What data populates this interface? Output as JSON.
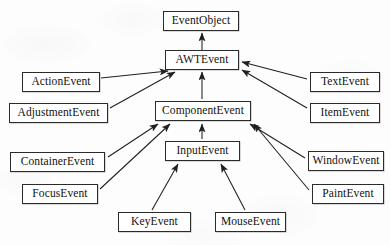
{
  "diagram": {
    "type": "class-hierarchy",
    "arrow_semantics": "generalization: arrow points from subclass to superclass",
    "canvas": {
      "width": 390,
      "height": 245
    },
    "style": {
      "background": "#fdfdfd",
      "box_fill": "#ffffff",
      "box_border": "#2b2b2b",
      "text_color": "#111111",
      "edge_color": "#1f1f1f"
    },
    "nodes": [
      {
        "id": "eventobject",
        "label": "EventObject",
        "x": 163,
        "y": 11,
        "w": 76,
        "h": 20
      },
      {
        "id": "awtevent",
        "label": "AWTEvent",
        "x": 165,
        "y": 50,
        "w": 74,
        "h": 20
      },
      {
        "id": "actionevent",
        "label": "ActionEvent",
        "x": 22,
        "y": 72,
        "w": 78,
        "h": 20
      },
      {
        "id": "textevent",
        "label": "TextEvent",
        "x": 310,
        "y": 72,
        "w": 70,
        "h": 20
      },
      {
        "id": "adjustmentevent",
        "label": "AdjustmentEvent",
        "x": 9,
        "y": 103,
        "w": 99,
        "h": 20
      },
      {
        "id": "componentevent",
        "label": "ComponentEvent",
        "x": 155,
        "y": 101,
        "w": 96,
        "h": 20
      },
      {
        "id": "itemevent",
        "label": "ItemEvent",
        "x": 310,
        "y": 103,
        "w": 70,
        "h": 20
      },
      {
        "id": "containerevent",
        "label": "ContainerEvent",
        "x": 10,
        "y": 152,
        "w": 95,
        "h": 20
      },
      {
        "id": "inputevent",
        "label": "InputEvent",
        "x": 165,
        "y": 141,
        "w": 75,
        "h": 20
      },
      {
        "id": "windowevent",
        "label": "WindowEvent",
        "x": 308,
        "y": 151,
        "w": 76,
        "h": 20
      },
      {
        "id": "focusevent",
        "label": "FocusEvent",
        "x": 22,
        "y": 184,
        "w": 76,
        "h": 20
      },
      {
        "id": "paintevent",
        "label": "PaintEvent",
        "x": 312,
        "y": 184,
        "w": 72,
        "h": 20
      },
      {
        "id": "keyevent",
        "label": "KeyEvent",
        "x": 118,
        "y": 212,
        "w": 73,
        "h": 20
      },
      {
        "id": "mouseevent",
        "label": "MouseEvent",
        "x": 215,
        "y": 212,
        "w": 71,
        "h": 20
      }
    ],
    "edges": [
      {
        "from": "awtevent",
        "to": "eventobject",
        "x1": 202,
        "y1": 50,
        "x2": 202,
        "y2": 33
      },
      {
        "from": "actionevent",
        "to": "awtevent",
        "x1": 101,
        "y1": 78,
        "x2": 168,
        "y2": 71
      },
      {
        "from": "adjustmentevent",
        "to": "awtevent",
        "x1": 110,
        "y1": 108,
        "x2": 175,
        "y2": 72
      },
      {
        "from": "componentevent",
        "to": "awtevent",
        "x1": 202,
        "y1": 99,
        "x2": 202,
        "y2": 72
      },
      {
        "from": "textevent",
        "to": "awtevent",
        "x1": 307,
        "y1": 79,
        "x2": 242,
        "y2": 62
      },
      {
        "from": "itemevent",
        "to": "awtevent",
        "x1": 307,
        "y1": 108,
        "x2": 242,
        "y2": 70
      },
      {
        "from": "containerevent",
        "to": "componentevent",
        "x1": 108,
        "y1": 157,
        "x2": 158,
        "y2": 124
      },
      {
        "from": "focusevent",
        "to": "componentevent",
        "x1": 100,
        "y1": 189,
        "x2": 170,
        "y2": 124
      },
      {
        "from": "inputevent",
        "to": "componentevent",
        "x1": 202,
        "y1": 139,
        "x2": 202,
        "y2": 124
      },
      {
        "from": "windowevent",
        "to": "componentevent",
        "x1": 305,
        "y1": 158,
        "x2": 250,
        "y2": 124
      },
      {
        "from": "paintevent",
        "to": "componentevent",
        "x1": 309,
        "y1": 190,
        "x2": 254,
        "y2": 124
      },
      {
        "from": "keyevent",
        "to": "inputevent",
        "x1": 152,
        "y1": 210,
        "x2": 178,
        "y2": 164
      },
      {
        "from": "mouseevent",
        "to": "inputevent",
        "x1": 245,
        "y1": 210,
        "x2": 221,
        "y2": 164
      }
    ]
  }
}
